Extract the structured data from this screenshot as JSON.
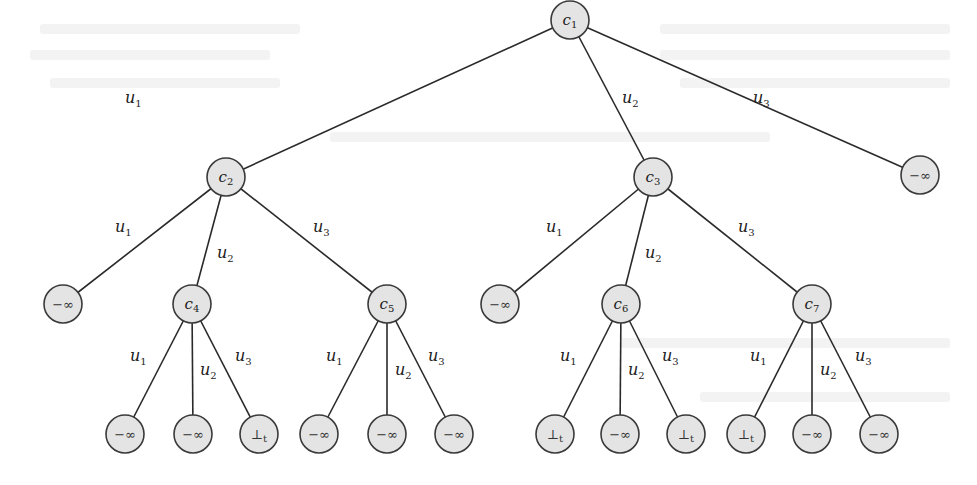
{
  "figure": {
    "type": "game-tree",
    "node_fill": "#e4e4e4",
    "stroke_color": "#2a2a2a"
  },
  "nodes": [
    {
      "id": "c1",
      "label": "c",
      "sub": "1",
      "kind": "internal",
      "x": 570,
      "y": 20
    },
    {
      "id": "c2",
      "label": "c",
      "sub": "2",
      "kind": "internal",
      "x": 226,
      "y": 177
    },
    {
      "id": "c3",
      "label": "c",
      "sub": "3",
      "kind": "internal",
      "x": 653,
      "y": 177
    },
    {
      "id": "n_top_leaf",
      "label": "−∞",
      "kind": "leaf",
      "x": 920,
      "y": 175
    },
    {
      "id": "n_c2_u1",
      "label": "−∞",
      "kind": "leaf",
      "x": 63,
      "y": 304
    },
    {
      "id": "c4",
      "label": "c",
      "sub": "4",
      "kind": "internal",
      "x": 192,
      "y": 304
    },
    {
      "id": "c5",
      "label": "c",
      "sub": "5",
      "kind": "internal",
      "x": 387,
      "y": 304
    },
    {
      "id": "n_c3_u1",
      "label": "−∞",
      "kind": "leaf",
      "x": 500,
      "y": 304
    },
    {
      "id": "c6",
      "label": "c",
      "sub": "6",
      "kind": "internal",
      "x": 621,
      "y": 304
    },
    {
      "id": "c7",
      "label": "c",
      "sub": "7",
      "kind": "internal",
      "x": 812,
      "y": 304
    },
    {
      "id": "l1",
      "label": "−∞",
      "kind": "leaf",
      "x": 125,
      "y": 434
    },
    {
      "id": "l2",
      "label": "−∞",
      "kind": "leaf",
      "x": 193,
      "y": 434
    },
    {
      "id": "l3",
      "label": "⊥",
      "sub": "t",
      "kind": "leaf",
      "x": 259,
      "y": 434
    },
    {
      "id": "l4",
      "label": "−∞",
      "kind": "leaf",
      "x": 319,
      "y": 434
    },
    {
      "id": "l5",
      "label": "−∞",
      "kind": "leaf",
      "x": 387,
      "y": 434
    },
    {
      "id": "l6",
      "label": "−∞",
      "kind": "leaf",
      "x": 454,
      "y": 434
    },
    {
      "id": "l7",
      "label": "⊥",
      "sub": "t",
      "kind": "leaf",
      "x": 555,
      "y": 434
    },
    {
      "id": "l8",
      "label": "−∞",
      "kind": "leaf",
      "x": 620,
      "y": 434
    },
    {
      "id": "l9",
      "label": "⊥",
      "sub": "t",
      "kind": "leaf",
      "x": 686,
      "y": 434
    },
    {
      "id": "l10",
      "label": "⊥",
      "sub": "t",
      "kind": "leaf",
      "x": 746,
      "y": 434
    },
    {
      "id": "l11",
      "label": "−∞",
      "kind": "leaf",
      "x": 812,
      "y": 434
    },
    {
      "id": "l12",
      "label": "−∞",
      "kind": "leaf",
      "x": 879,
      "y": 434
    }
  ],
  "edges": [
    {
      "from": "c1",
      "to": "c2",
      "label": "u",
      "sub": "1",
      "lx": 125,
      "ly": 103
    },
    {
      "from": "c1",
      "to": "c3",
      "label": "u",
      "sub": "2",
      "lx": 622,
      "ly": 103
    },
    {
      "from": "c1",
      "to": "n_top_leaf",
      "label": "u",
      "sub": "3",
      "lx": 753,
      "ly": 103
    },
    {
      "from": "c2",
      "to": "n_c2_u1",
      "label": "u",
      "sub": "1",
      "lx": 115,
      "ly": 232
    },
    {
      "from": "c2",
      "to": "c4",
      "label": "u",
      "sub": "2",
      "lx": 217,
      "ly": 258
    },
    {
      "from": "c2",
      "to": "c5",
      "label": "u",
      "sub": "3",
      "lx": 313,
      "ly": 232
    },
    {
      "from": "c3",
      "to": "n_c3_u1",
      "label": "u",
      "sub": "1",
      "lx": 546,
      "ly": 232
    },
    {
      "from": "c3",
      "to": "c6",
      "label": "u",
      "sub": "2",
      "lx": 645,
      "ly": 258
    },
    {
      "from": "c3",
      "to": "c7",
      "label": "u",
      "sub": "3",
      "lx": 738,
      "ly": 232
    },
    {
      "from": "c4",
      "to": "l1",
      "label": "u",
      "sub": "1",
      "lx": 130,
      "ly": 361
    },
    {
      "from": "c4",
      "to": "l2",
      "label": "u",
      "sub": "2",
      "lx": 200,
      "ly": 375
    },
    {
      "from": "c4",
      "to": "l3",
      "label": "u",
      "sub": "3",
      "lx": 235,
      "ly": 361
    },
    {
      "from": "c5",
      "to": "l4",
      "label": "u",
      "sub": "1",
      "lx": 326,
      "ly": 361
    },
    {
      "from": "c5",
      "to": "l5",
      "label": "u",
      "sub": "2",
      "lx": 395,
      "ly": 375
    },
    {
      "from": "c5",
      "to": "l6",
      "label": "u",
      "sub": "3",
      "lx": 428,
      "ly": 361
    },
    {
      "from": "c6",
      "to": "l7",
      "label": "u",
      "sub": "1",
      "lx": 560,
      "ly": 361
    },
    {
      "from": "c6",
      "to": "l8",
      "label": "u",
      "sub": "2",
      "lx": 628,
      "ly": 375
    },
    {
      "from": "c6",
      "to": "l9",
      "label": "u",
      "sub": "3",
      "lx": 662,
      "ly": 361
    },
    {
      "from": "c7",
      "to": "l10",
      "label": "u",
      "sub": "1",
      "lx": 750,
      "ly": 361
    },
    {
      "from": "c7",
      "to": "l11",
      "label": "u",
      "sub": "2",
      "lx": 820,
      "ly": 375
    },
    {
      "from": "c7",
      "to": "l12",
      "label": "u",
      "sub": "3",
      "lx": 855,
      "ly": 361
    }
  ]
}
